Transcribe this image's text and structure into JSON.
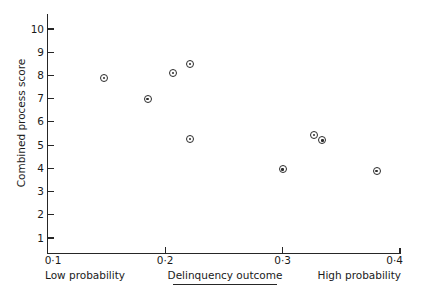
{
  "chart_data": {
    "type": "scatter",
    "title": "",
    "xlabel": "Delinquency outcome",
    "ylabel": "Combined process score",
    "xlim": [
      0.1,
      0.4
    ],
    "ylim": [
      0,
      10.8
    ],
    "grid": false,
    "legend": "none",
    "x_tick_labels": [
      "0·1",
      "0·2",
      "0·3",
      "0·4"
    ],
    "x_tick_values": [
      0.1,
      0.2,
      0.3,
      0.4
    ],
    "y_tick_labels": [
      "1",
      "2",
      "3",
      "4",
      "5",
      "6",
      "7",
      "8",
      "9",
      "10"
    ],
    "y_tick_values": [
      1,
      2,
      3,
      4,
      5,
      6,
      7,
      8,
      9,
      10
    ],
    "x_axis_end_labels": {
      "left": "Low probability",
      "right": "High probability"
    },
    "marker": "circle-with-dot",
    "points": [
      {
        "x": 0.148,
        "y": 7.9
      },
      {
        "x": 0.185,
        "y": 7.0
      },
      {
        "x": 0.207,
        "y": 8.1
      },
      {
        "x": 0.221,
        "y": 8.5
      },
      {
        "x": 0.221,
        "y": 5.25
      },
      {
        "x": 0.3,
        "y": 3.95
      },
      {
        "x": 0.327,
        "y": 5.45
      },
      {
        "x": 0.334,
        "y": 5.2
      },
      {
        "x": 0.38,
        "y": 3.9
      }
    ]
  },
  "colors": {
    "ink": "#262626",
    "marker": "#2b2b2b",
    "background": "#ffffff"
  }
}
